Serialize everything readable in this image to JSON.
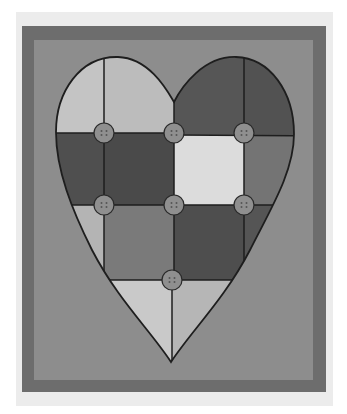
{
  "artwork": {
    "subject": "quilted patchwork heart with buttons",
    "colors": {
      "page_bg": "#ffffff",
      "card": "#ececec",
      "frame_border": "#6d6d6d",
      "frame_inner": "#8d8d8d",
      "outline": "#1e1e1e",
      "button_fill": "#8f8f8f"
    },
    "patches": [
      {
        "id": "r1-left",
        "fill": "#c4c4c4"
      },
      {
        "id": "r1-midleft",
        "fill": "#bcbcbc"
      },
      {
        "id": "r1-right",
        "fill": "#565656"
      },
      {
        "id": "r1-farright",
        "fill": "#525252"
      },
      {
        "id": "r2-left",
        "fill": "#4f4f4f"
      },
      {
        "id": "r2-midleft",
        "fill": "#4a4a4a"
      },
      {
        "id": "r2-midright",
        "fill": "#dcdcdc"
      },
      {
        "id": "r2-right",
        "fill": "#747474"
      },
      {
        "id": "r3-left",
        "fill": "#b4b4b4"
      },
      {
        "id": "r3-midleft",
        "fill": "#7a7a7a"
      },
      {
        "id": "r3-midright",
        "fill": "#4e4e4e"
      },
      {
        "id": "r3-right",
        "fill": "#555555"
      },
      {
        "id": "r4-left",
        "fill": "#c9c9c9"
      },
      {
        "id": "r4-right",
        "fill": "#b6b6b6"
      }
    ],
    "buttons": [
      {
        "cx": 104,
        "cy": 133
      },
      {
        "cx": 174,
        "cy": 133
      },
      {
        "cx": 244,
        "cy": 133
      },
      {
        "cx": 104,
        "cy": 205
      },
      {
        "cx": 174,
        "cy": 205
      },
      {
        "cx": 244,
        "cy": 205
      },
      {
        "cx": 172,
        "cy": 280
      }
    ]
  }
}
